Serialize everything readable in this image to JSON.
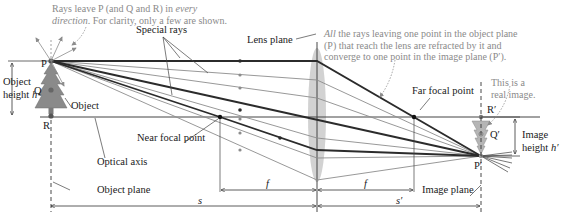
{
  "diagram": {
    "notes": {
      "rays_leave_line1_prefix": "Rays leave P (and Q and R) in ",
      "rays_leave_line1_em": "every",
      "rays_leave_line2_em": "direction",
      "rays_leave_line2_rest": ". For clarity, only a few are shown.",
      "all_rays_em": "All",
      "all_rays_line1_rest": " the rays leaving one point in the object plane",
      "all_rays_line2": "(P) that reach the lens are refracted by it and",
      "all_rays_line3": "converge to one point in the image plane (P′).",
      "real_image_line1": "This is a",
      "real_image_line2": "real image."
    },
    "labels": {
      "special_rays": "Special rays",
      "lens_plane": "Lens plane",
      "object_height_line1": "Object",
      "object_height_line2": "height ",
      "object_height_var": "h",
      "object": "Object",
      "near_focal_point": "Near focal point",
      "far_focal_point": "Far focal point",
      "optical_axis": "Optical axis",
      "object_plane": "Object plane",
      "image_plane": "Image plane",
      "image_height_line1": "Image",
      "image_height_line2": "height ",
      "image_height_var": "h′"
    },
    "points": {
      "P": "P",
      "Q": "Q",
      "R": "R",
      "P_prime": "P′",
      "Q_prime": "Q′",
      "R_prime": "R′"
    },
    "dimensions": {
      "f_near": "f",
      "f_far": "f",
      "s": "s",
      "s_prime": "s′"
    },
    "colors": {
      "special_ray": "#2b2b2b",
      "other_ray": "#8c8c8c",
      "lens_fill": "#cfcfcf",
      "object_fill": "#8a8a8a",
      "image_fill": "#b5b5b5",
      "note_text": "#8a8a8a"
    },
    "geometry": {
      "object_plane_x": 50,
      "lens_x": 317,
      "image_plane_x": 481,
      "optical_axis_y": 117,
      "P_y": 61,
      "P_prime_y": 156,
      "near_focal_x": 220,
      "far_focal_x": 414
    }
  }
}
